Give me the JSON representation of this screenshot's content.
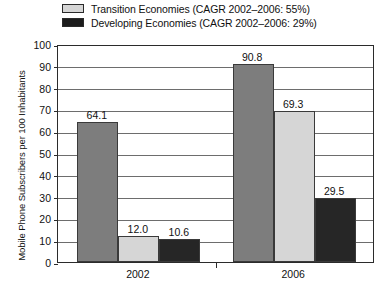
{
  "chart_data": {
    "type": "bar",
    "title": "",
    "subtitle": "",
    "xlabel": "",
    "ylabel": "Mobile Phone Subscribers per 100 Inhabitants",
    "categories": [
      "2002",
      "2006"
    ],
    "ylim": [
      0,
      100
    ],
    "yticks": [
      "0",
      "10",
      "20",
      "30",
      "40",
      "50",
      "60",
      "70",
      "80",
      "90",
      "100"
    ],
    "grid": true,
    "legend_position": "top",
    "series": [
      {
        "name": "",
        "legend_shown": false,
        "color": "#7d7d7d",
        "values": [
          64.1,
          90.8
        ],
        "labels": [
          "64.1",
          "90.8"
        ]
      },
      {
        "name": "Transition Economies (CAGR 2002–2006: 55%)",
        "legend_shown": true,
        "color": "#d6d6d6",
        "values": [
          12.0,
          69.3
        ],
        "labels": [
          "12.0",
          "69.3"
        ]
      },
      {
        "name": "Developing Economies (CAGR 2002–2006: 29%)",
        "legend_shown": true,
        "color": "#262626",
        "values": [
          10.6,
          29.5
        ],
        "labels": [
          "10.6",
          "29.5"
        ]
      }
    ]
  },
  "legend": {
    "items": [
      {
        "label": "Transition Economies (CAGR 2002–2006: 55%)",
        "swatch": "light"
      },
      {
        "label": "Developing Economies (CAGR 2002–2006: 29%)",
        "swatch": "dark"
      }
    ]
  },
  "axis": {
    "y_title": "Mobile Phone Subscribers per 100 Inhabitants",
    "y_ticks": [
      "100",
      "90",
      "80",
      "70",
      "60",
      "50",
      "40",
      "30",
      "20",
      "10",
      "0"
    ],
    "x_ticks": [
      "2002",
      "2006"
    ]
  }
}
